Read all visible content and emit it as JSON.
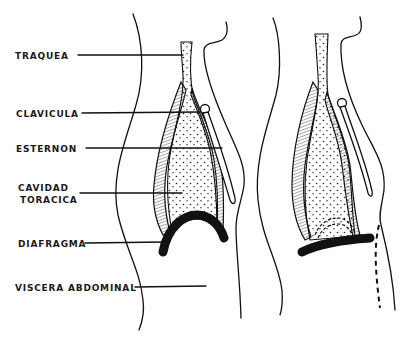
{
  "diagram": {
    "type": "anatomical-line-drawing",
    "figures": [
      {
        "id": "left",
        "description": "Torso sagittal view, diaphragm raised (dome shape)"
      },
      {
        "id": "right",
        "description": "Torso sagittal view, diaphragm lowered (flattened), abdomen expanded (dashed)"
      }
    ],
    "labels": [
      {
        "id": "traquea",
        "line1": "TRAQUEA",
        "line2": ""
      },
      {
        "id": "clavicula",
        "line1": "CLAVICULA",
        "line2": ""
      },
      {
        "id": "esternon",
        "line1": "ESTERNON",
        "line2": ""
      },
      {
        "id": "cavidad",
        "line1": "CAVIDAD",
        "line2": "TORACICA"
      },
      {
        "id": "diafragma",
        "line1": "DIAFRAGMA",
        "line2": ""
      },
      {
        "id": "viscera",
        "line1": "VISCERA ABDOMINAL",
        "line2": ""
      }
    ],
    "colors": {
      "ink": "#111111",
      "background": "#ffffff"
    }
  }
}
